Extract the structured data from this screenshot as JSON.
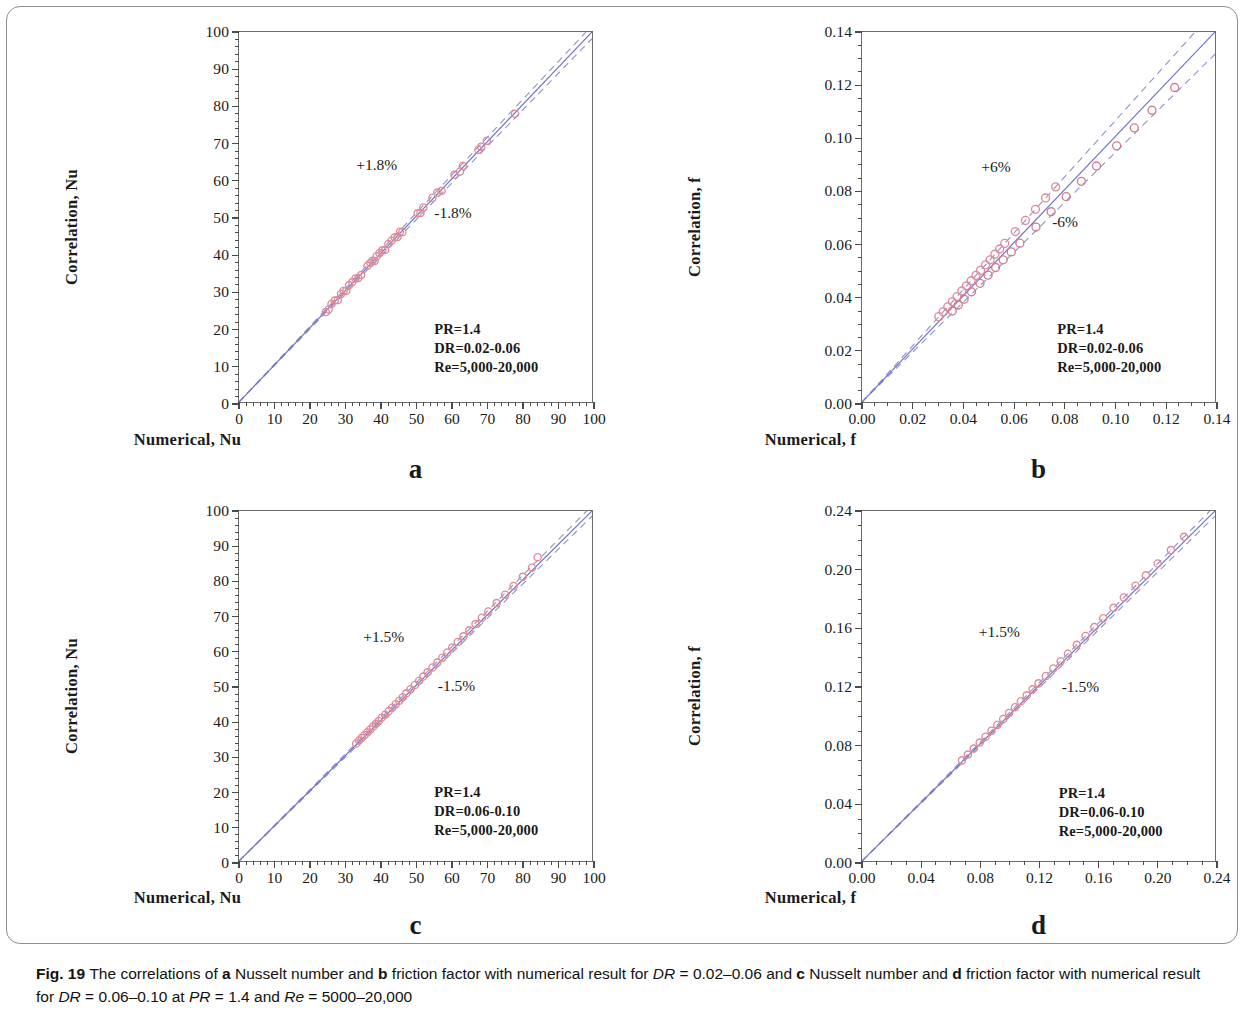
{
  "figure": {
    "label": "Fig. 19",
    "caption_parts": [
      {
        "text": "Fig. 19 ",
        "style": "bold"
      },
      {
        "text": "The correlations of ",
        "style": "normal"
      },
      {
        "text": "a",
        "style": "bold"
      },
      {
        "text": " Nusselt number and ",
        "style": "normal"
      },
      {
        "text": "b",
        "style": "bold"
      },
      {
        "text": " friction factor with numerical result for ",
        "style": "normal"
      },
      {
        "text": "DR",
        "style": "italic"
      },
      {
        "text": " = 0.02–0.06 and ",
        "style": "normal"
      },
      {
        "text": "c",
        "style": "bold"
      },
      {
        "text": " Nusselt number and ",
        "style": "normal"
      },
      {
        "text": "d",
        "style": "bold"
      },
      {
        "text": " friction factor with numerical result for ",
        "style": "normal"
      },
      {
        "text": "DR",
        "style": "italic"
      },
      {
        "text": " = 0.06–0.10 at ",
        "style": "normal"
      },
      {
        "text": "PR",
        "style": "italic"
      },
      {
        "text": " = 1.4 and ",
        "style": "normal"
      },
      {
        "text": "Re",
        "style": "italic"
      },
      {
        "text": " = 5000–20,000",
        "style": "normal"
      }
    ],
    "caption_plain": "Fig. 19 The correlations of a Nusselt number and b friction factor with numerical result for DR = 0.02–0.06 and c Nusselt number and d friction factor with numerical result for DR = 0.06–0.10 at PR = 1.4 and Re = 5000–20,000"
  },
  "colors": {
    "marker_stroke": "#e08a95",
    "marker_stroke_alt": "#cf7d8c",
    "parity_line": "#6e72c4",
    "bound_line": "#8d90cf",
    "axis": "#5a5a5a",
    "text": "#1a1a1a",
    "frame": "#8e8e8e"
  },
  "chart_data": [
    {
      "panel": "a",
      "letter": "a",
      "type": "scatter",
      "title": "",
      "xlabel": "Numerical, Nu",
      "ylabel": "Correlation, Nu",
      "xlim": [
        0,
        100
      ],
      "ylim": [
        0,
        100
      ],
      "xticks": [
        0,
        10,
        20,
        30,
        40,
        50,
        60,
        70,
        80,
        90,
        100
      ],
      "yticks": [
        0,
        10,
        20,
        30,
        40,
        50,
        60,
        70,
        80,
        90,
        100
      ],
      "xticklabels": [
        "0",
        "10",
        "20",
        "30",
        "40",
        "50",
        "60",
        "70",
        "80",
        "90",
        "100"
      ],
      "yticklabels": [
        "0",
        "10",
        "20",
        "30",
        "40",
        "50",
        "60",
        "70",
        "80",
        "90",
        "100"
      ],
      "minor_ticks_per_major": 5,
      "grid": false,
      "legend": null,
      "band_percent": 1.8,
      "annotations": [
        {
          "text": "+1.8%",
          "x": 33,
          "y": 64
        },
        {
          "text": "-1.8%",
          "x": 55,
          "y": 51
        }
      ],
      "info_box": {
        "lines": [
          "PR=1.4",
          "DR=0.02-0.06",
          "Re=5,000-20,000"
        ],
        "x": 55,
        "y": 20
      },
      "parity_line": {
        "from": [
          0,
          0
        ],
        "to": [
          100,
          100
        ],
        "style": "solid"
      },
      "upper_bound": {
        "from": [
          0,
          0
        ],
        "to": [
          98.3,
          100
        ],
        "style": "dashed",
        "label": "+1.8%"
      },
      "lower_bound": {
        "from": [
          0,
          0
        ],
        "to": [
          100,
          98.2
        ],
        "style": "dashed",
        "label": "-1.8%"
      },
      "series": [
        {
          "name": "Nu correlation vs numerical",
          "marker": "open-circle",
          "x": [
            24.6,
            25.4,
            26.2,
            27.1,
            28.0,
            28.9,
            29.6,
            30.4,
            31.2,
            32.1,
            33.0,
            33.8,
            34.6,
            36.4,
            37.2,
            37.8,
            38.4,
            39.0,
            39.8,
            40.6,
            41.4,
            42.3,
            43.2,
            44.1,
            44.9,
            45.6,
            46.3,
            50.6,
            51.4,
            52.2,
            54.8,
            56.2,
            57.4,
            61.0,
            62.6,
            63.4,
            67.8,
            68.6,
            70.2,
            78.2
          ],
          "y": [
            24.3,
            25.0,
            26.5,
            27.4,
            27.6,
            29.2,
            30.0,
            30.1,
            31.6,
            32.4,
            33.4,
            33.5,
            34.3,
            36.8,
            37.6,
            38.2,
            38.1,
            39.4,
            40.2,
            41.0,
            41.1,
            42.7,
            43.6,
            44.5,
            44.6,
            46.0,
            45.9,
            51.0,
            51.1,
            52.6,
            55.2,
            56.6,
            57.1,
            61.4,
            62.3,
            63.8,
            68.2,
            69.0,
            70.6,
            77.9
          ]
        }
      ]
    },
    {
      "panel": "b",
      "letter": "b",
      "type": "scatter",
      "title": "",
      "xlabel": "Numerical, f",
      "ylabel": "Correlation, f",
      "xlim": [
        0,
        0.14
      ],
      "ylim": [
        0,
        0.14
      ],
      "xticks": [
        0.0,
        0.02,
        0.04,
        0.06,
        0.08,
        0.1,
        0.12,
        0.14
      ],
      "yticks": [
        0.0,
        0.02,
        0.04,
        0.06,
        0.08,
        0.1,
        0.12,
        0.14
      ],
      "xticklabels": [
        "0.00",
        "0.02",
        "0.04",
        "0.06",
        "0.08",
        "0.10",
        "0.12",
        "0.14"
      ],
      "yticklabels": [
        "0.00",
        "0.02",
        "0.04",
        "0.06",
        "0.08",
        "0.10",
        "0.12",
        "0.14"
      ],
      "minor_ticks_per_major": 4,
      "grid": false,
      "legend": null,
      "band_percent": 6,
      "annotations": [
        {
          "text": "+6%",
          "x": 0.047,
          "y": 0.089
        },
        {
          "text": "-6%",
          "x": 0.075,
          "y": 0.068
        }
      ],
      "info_box": {
        "lines": [
          "PR=1.4",
          "DR=0.02-0.06",
          "Re=5,000-20,000"
        ],
        "x": 0.077,
        "y": 0.028
      },
      "parity_line": {
        "from": [
          0,
          0
        ],
        "to": [
          0.14,
          0.14
        ],
        "style": "solid"
      },
      "upper_bound": {
        "from": [
          0,
          0
        ],
        "to": [
          0.1321,
          0.14
        ],
        "style": "dashed",
        "label": "+6%"
      },
      "lower_bound": {
        "from": [
          0,
          0
        ],
        "to": [
          0.14,
          0.1316
        ],
        "style": "dashed",
        "label": "-6%"
      },
      "series": [
        {
          "name": "f correlation vs numerical (upper band)",
          "marker": "open-circle",
          "x": [
            0.0305,
            0.0322,
            0.034,
            0.0358,
            0.0377,
            0.0396,
            0.0414,
            0.0433,
            0.0452,
            0.047,
            0.049,
            0.0508,
            0.0527,
            0.0546,
            0.0566,
            0.0608,
            0.0648,
            0.0688,
            0.0728,
            0.0768
          ],
          "y": [
            0.0323,
            0.0341,
            0.036,
            0.0379,
            0.0399,
            0.042,
            0.0439,
            0.0459,
            0.0479,
            0.0498,
            0.0519,
            0.0538,
            0.0559,
            0.0579,
            0.06,
            0.0645,
            0.0687,
            0.0729,
            0.0772,
            0.0814
          ]
        },
        {
          "name": "f correlation vs numerical (lower band)",
          "marker": "open-circle",
          "x": [
            0.0358,
            0.0382,
            0.0405,
            0.0434,
            0.0468,
            0.05,
            0.053,
            0.056,
            0.0592,
            0.0626,
            0.069,
            0.075,
            0.081,
            0.087,
            0.093,
            0.101,
            0.108,
            0.115,
            0.124
          ],
          "y": [
            0.0344,
            0.0367,
            0.0389,
            0.0417,
            0.0449,
            0.048,
            0.0509,
            0.0538,
            0.0568,
            0.0601,
            0.0662,
            0.072,
            0.0777,
            0.0835,
            0.0893,
            0.0969,
            0.1037,
            0.1104,
            0.119
          ]
        }
      ]
    },
    {
      "panel": "c",
      "letter": "c",
      "type": "scatter",
      "title": "",
      "xlabel": "Numerical, Nu",
      "ylabel": "Correlation, Nu",
      "xlim": [
        0,
        100
      ],
      "ylim": [
        0,
        100
      ],
      "xticks": [
        0,
        10,
        20,
        30,
        40,
        50,
        60,
        70,
        80,
        90,
        100
      ],
      "yticks": [
        0,
        10,
        20,
        30,
        40,
        50,
        60,
        70,
        80,
        90,
        100
      ],
      "xticklabels": [
        "0",
        "10",
        "20",
        "30",
        "40",
        "50",
        "60",
        "70",
        "80",
        "90",
        "100"
      ],
      "yticklabels": [
        "0",
        "10",
        "20",
        "30",
        "40",
        "50",
        "60",
        "70",
        "80",
        "90",
        "100"
      ],
      "minor_ticks_per_major": 5,
      "grid": false,
      "legend": null,
      "band_percent": 1.5,
      "annotations": [
        {
          "text": "+1.5%",
          "x": 35,
          "y": 64
        },
        {
          "text": "-1.5%",
          "x": 56,
          "y": 50
        }
      ],
      "info_box": {
        "lines": [
          "PR=1.4",
          "DR=0.06-0.10",
          "Re=5,000-20,000"
        ],
        "x": 55,
        "y": 20
      },
      "parity_line": {
        "from": [
          0,
          0
        ],
        "to": [
          100,
          100
        ],
        "style": "solid"
      },
      "upper_bound": {
        "from": [
          0,
          0
        ],
        "to": [
          98.5,
          100
        ],
        "style": "dashed",
        "label": "+1.5%"
      },
      "lower_bound": {
        "from": [
          0,
          0
        ],
        "to": [
          100,
          98.5
        ],
        "style": "dashed",
        "label": "-1.5%"
      },
      "series": [
        {
          "name": "Nu correlation vs numerical",
          "marker": "open-circle",
          "x": [
            33.2,
            34.0,
            34.8,
            35.6,
            36.4,
            37.2,
            38.0,
            38.8,
            39.6,
            40.4,
            41.4,
            42.4,
            43.4,
            44.4,
            45.4,
            46.4,
            47.4,
            48.6,
            49.8,
            51.0,
            52.2,
            53.4,
            54.8,
            56.2,
            57.6,
            59.0,
            60.4,
            62.0,
            63.6,
            65.2,
            67.0,
            68.8,
            70.6,
            73.0,
            75.4,
            77.8,
            80.4,
            83.0,
            84.6
          ],
          "y": [
            33.6,
            34.4,
            35.2,
            36.0,
            36.8,
            37.6,
            38.4,
            39.2,
            40.0,
            40.9,
            41.8,
            42.8,
            43.8,
            44.8,
            45.8,
            46.8,
            47.9,
            49.1,
            50.3,
            51.5,
            52.7,
            53.9,
            55.3,
            56.7,
            58.1,
            59.6,
            61.0,
            62.6,
            64.2,
            65.9,
            67.7,
            69.5,
            71.3,
            73.7,
            76.1,
            78.6,
            81.2,
            83.8,
            86.8
          ]
        }
      ]
    },
    {
      "panel": "d",
      "letter": "d",
      "type": "scatter",
      "title": "",
      "xlabel": "Numerical, f",
      "ylabel": "Correlation, f",
      "xlim": [
        0,
        0.24
      ],
      "ylim": [
        0,
        0.24
      ],
      "xticks": [
        0.0,
        0.04,
        0.08,
        0.12,
        0.16,
        0.2,
        0.24
      ],
      "yticks": [
        0.0,
        0.04,
        0.08,
        0.12,
        0.16,
        0.2,
        0.24
      ],
      "xticklabels": [
        "0.00",
        "0.04",
        "0.08",
        "0.12",
        "0.16",
        "0.20",
        "0.24"
      ],
      "yticklabels": [
        "0.00",
        "0.04",
        "0.08",
        "0.12",
        "0.16",
        "0.20",
        "0.24"
      ],
      "minor_ticks_per_major": 4,
      "grid": false,
      "legend": null,
      "band_percent": 1.5,
      "annotations": [
        {
          "text": "+1.5%",
          "x": 0.079,
          "y": 0.157
        },
        {
          "text": "-1.5%",
          "x": 0.135,
          "y": 0.119
        }
      ],
      "info_box": {
        "lines": [
          "PR=1.4",
          "DR=0.06-0.10",
          "Re=5,000-20,000"
        ],
        "x": 0.133,
        "y": 0.047
      },
      "parity_line": {
        "from": [
          0,
          0
        ],
        "to": [
          0.24,
          0.24
        ],
        "style": "solid"
      },
      "upper_bound": {
        "from": [
          0,
          0
        ],
        "to": [
          0.2365,
          0.24
        ],
        "style": "dashed",
        "label": "+1.5%"
      },
      "lower_bound": {
        "from": [
          0,
          0
        ],
        "to": [
          0.24,
          0.2365
        ],
        "style": "dashed",
        "label": "-1.5%"
      },
      "series": [
        {
          "name": "f correlation vs numerical",
          "marker": "open-circle",
          "x": [
            0.068,
            0.072,
            0.076,
            0.08,
            0.084,
            0.088,
            0.092,
            0.096,
            0.1,
            0.104,
            0.108,
            0.112,
            0.116,
            0.12,
            0.125,
            0.13,
            0.135,
            0.14,
            0.146,
            0.152,
            0.158,
            0.164,
            0.171,
            0.178,
            0.186,
            0.193,
            0.201,
            0.21,
            0.219
          ],
          "y": [
            0.069,
            0.073,
            0.0771,
            0.0812,
            0.0852,
            0.0893,
            0.0933,
            0.0974,
            0.1015,
            0.1055,
            0.1096,
            0.1136,
            0.1177,
            0.1218,
            0.1269,
            0.132,
            0.137,
            0.1421,
            0.1482,
            0.1543,
            0.1604,
            0.1665,
            0.1736,
            0.1807,
            0.1888,
            0.1959,
            0.204,
            0.2132,
            0.2223
          ]
        }
      ]
    }
  ]
}
